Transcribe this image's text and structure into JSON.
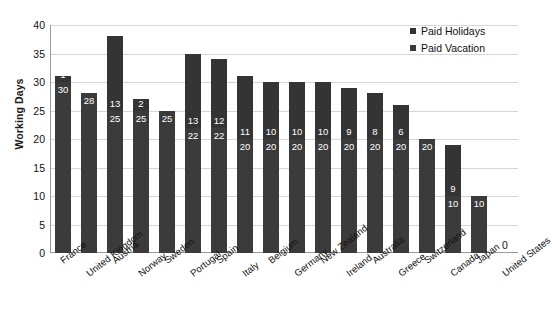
{
  "chart_data": {
    "type": "bar",
    "title": "",
    "subtitle": "",
    "xlabel": "",
    "ylabel": "Working Days",
    "ylim": [
      0,
      40
    ],
    "yticks": [
      0,
      5,
      10,
      15,
      20,
      25,
      30,
      35,
      40
    ],
    "grid": true,
    "stacked": true,
    "legend_position": "top-right",
    "categories": [
      "France",
      "United Kingdom",
      "Austria",
      "Norway",
      "Sweden",
      "Portugal",
      "Spain",
      "Italy",
      "Belgium",
      "Germany",
      "New Zealand",
      "Ireland",
      "Australia",
      "Greece",
      "Switzerland",
      "Canada",
      "Japan",
      "United States"
    ],
    "series": [
      {
        "name": "Paid Vacation",
        "color": "#3b3b3b",
        "values": [
          30,
          28,
          25,
          25,
          25,
          22,
          22,
          20,
          20,
          20,
          20,
          20,
          20,
          20,
          20,
          10,
          10,
          0
        ]
      },
      {
        "name": "Paid Holidays",
        "color": "#343434",
        "values": [
          1,
          0,
          13,
          2,
          0,
          13,
          12,
          11,
          10,
          10,
          10,
          9,
          8,
          6,
          0,
          9,
          0,
          0
        ]
      }
    ],
    "totals": [
      31,
      28,
      38,
      27,
      25,
      35,
      34,
      31,
      30,
      30,
      30,
      29,
      28,
      26,
      20,
      19,
      10,
      0
    ],
    "annotations": [
      {
        "category": "United States",
        "text": "0",
        "note": "zero-value label above axis"
      }
    ]
  },
  "legend": {
    "items": [
      {
        "label": "Paid Holidays",
        "color": "#343434"
      },
      {
        "label": "Paid Vacation",
        "color": "#3b3b3b"
      }
    ]
  },
  "axes": {
    "y_title": "Working Days"
  }
}
